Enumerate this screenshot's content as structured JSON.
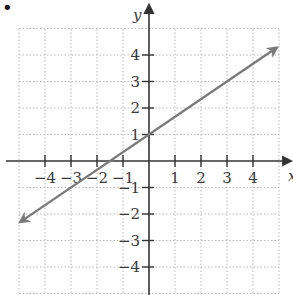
{
  "chart_data": {
    "type": "line",
    "title": "",
    "xlabel": "x",
    "ylabel": "y",
    "xlim": [
      -5,
      5
    ],
    "ylim": [
      -5,
      5
    ],
    "grid": true,
    "grid_style": "dotted",
    "x_ticks": [
      -4,
      -3,
      -2,
      -1,
      1,
      2,
      3,
      4
    ],
    "y_ticks": [
      -4,
      -3,
      -2,
      -1,
      1,
      2,
      3,
      4
    ],
    "x_tick_labels": [
      "−4",
      "−3",
      "−2",
      "−1",
      "1",
      "2",
      "3",
      "4"
    ],
    "y_tick_labels": [
      "−4",
      "−3",
      "−2",
      "−1",
      "1",
      "2",
      "3",
      "4"
    ],
    "series": [
      {
        "name": "line",
        "equation": "y = (2/3)x + 1",
        "slope": 0.6667,
        "intercept": 1,
        "x": [
          -4.96,
          -1.5,
          0,
          4.92
        ],
        "y": [
          -2.31,
          0,
          1,
          4.28
        ],
        "arrows": "both",
        "color": "#7a7a7a"
      }
    ],
    "bullet_marker": "•"
  },
  "colors": {
    "axis": "#333333",
    "grid": "#b8b8b8",
    "line": "#7a7a7a",
    "text": "#3a3a3a"
  }
}
